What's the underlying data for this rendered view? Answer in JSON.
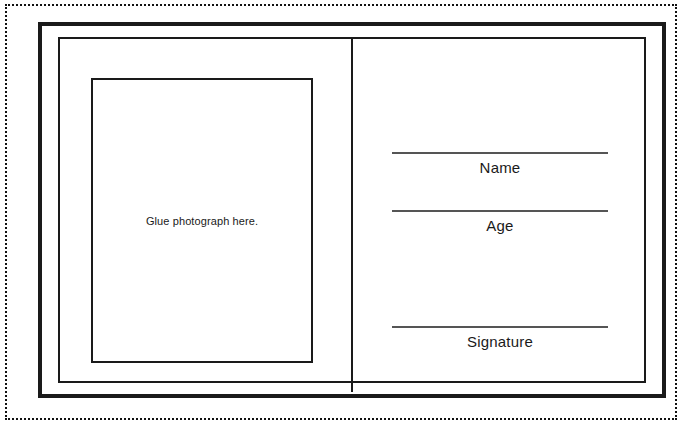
{
  "document": {
    "type": "identification-card-template",
    "photo_panel": {
      "caption": "Glue photograph here."
    },
    "fields": [
      {
        "id": "name",
        "label": "Name"
      },
      {
        "id": "age",
        "label": "Age"
      },
      {
        "id": "signature",
        "label": "Signature"
      }
    ]
  },
  "colors": {
    "ink": "#1a1a1a",
    "rule": "#555555",
    "paper": "#ffffff"
  }
}
